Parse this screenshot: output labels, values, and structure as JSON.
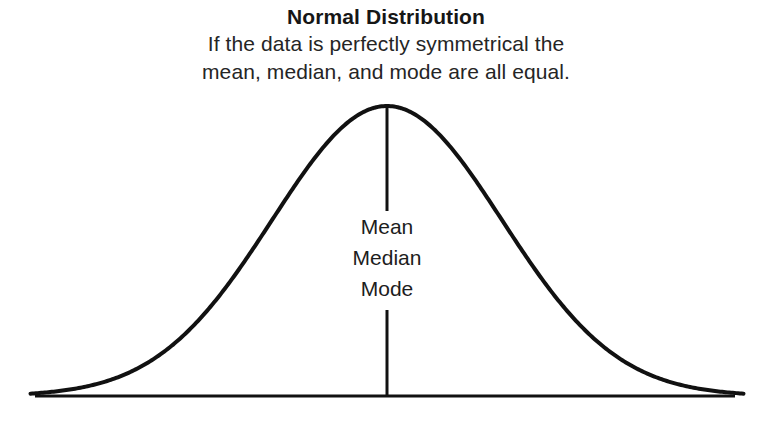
{
  "chart_data": {
    "type": "line",
    "title": "Normal Distribution",
    "subtitle_lines": [
      "If the data is perfectly symmetrical the",
      "mean, median, and mode are all equal."
    ],
    "xlabel": "",
    "ylabel": "",
    "grid": false,
    "legend": null,
    "annotations": [
      {
        "name": "mean",
        "label": "Mean",
        "x": 0,
        "y": 1.0
      },
      {
        "name": "median",
        "label": "Median",
        "x": 0,
        "y": 1.0
      },
      {
        "name": "mode",
        "label": "Mode",
        "x": 0,
        "y": 1.0
      }
    ],
    "series": [
      {
        "name": "normal-probability-density",
        "mean": 0,
        "sigma": 1,
        "x": [
          -3.1,
          -2.9,
          -2.7,
          -2.5,
          -2.3,
          -2.1,
          -1.9,
          -1.7,
          -1.5,
          -1.3,
          -1.1,
          -0.9,
          -0.7,
          -0.5,
          -0.3,
          -0.1,
          0.1,
          0.3,
          0.5,
          0.7,
          0.9,
          1.1,
          1.3,
          1.5,
          1.7,
          1.9,
          2.1,
          2.3,
          2.5,
          2.7,
          2.9,
          3.1
        ],
        "values": [
          0.008,
          0.015,
          0.026,
          0.044,
          0.071,
          0.11,
          0.164,
          0.235,
          0.325,
          0.43,
          0.546,
          0.667,
          0.783,
          0.882,
          0.956,
          0.995,
          0.995,
          0.956,
          0.882,
          0.783,
          0.667,
          0.546,
          0.43,
          0.325,
          0.235,
          0.164,
          0.11,
          0.071,
          0.044,
          0.026,
          0.015,
          0.008
        ]
      }
    ],
    "xlim": [
      -3.1,
      3.1
    ],
    "ylim": [
      0,
      1.05
    ],
    "axis_line": "baseline-only",
    "center_line": {
      "label": "mean-median-mode-marker",
      "x": 0
    },
    "colors": {
      "curve": "#111111",
      "axis": "#111111",
      "center_line": "#111111",
      "background": "#ffffff",
      "text": "#1a1a1a"
    }
  },
  "center_labels": {
    "mean": "Mean",
    "median": "Median",
    "mode": "Mode"
  },
  "heading": {
    "title": "Normal Distribution",
    "subtitle_1": "If the data is perfectly symmetrical the",
    "subtitle_2": "mean, median, and mode are all equal."
  }
}
